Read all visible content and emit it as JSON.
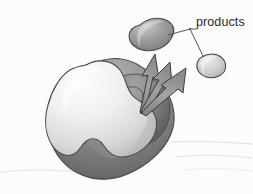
{
  "figure": {
    "kind": "enzyme-product-release-illustration",
    "style": "grayscale airbrush pencil rendering",
    "background_color": "#fcfcfc"
  },
  "labels": {
    "products": "products"
  },
  "colors": {
    "background": "#fcfcfc",
    "outline": "#4a4a4a",
    "enzyme_front_light": "#f2f2f2",
    "enzyme_front_mid": "#d7d7d7",
    "enzyme_back_dark": "#6f6f6f",
    "active_site_dark": "#777777",
    "active_site_darker": "#555555",
    "product_large_dark": "#8a8a8a",
    "product_small_light": "#cfcfcf",
    "arrow_fill": "#9a9a9a",
    "arrow_edge": "#3f3f3f",
    "ground_line": "#e2e2e2",
    "text": "#2b2b2b",
    "leader_line": "#555555"
  },
  "elements": {
    "enzyme_body": "enzyme-body",
    "enzyme_front_lobe": "enzyme-front-lobe",
    "active_site_cleft": "active-site-cleft",
    "product_large": "product-molecule-large",
    "product_small": "product-molecule-small",
    "arrows": [
      {
        "name": "release-arrow-up",
        "from": [
          141,
          111
        ],
        "to": [
          155,
          55
        ]
      },
      {
        "name": "release-arrow-mid",
        "from": [
          141,
          111
        ],
        "to": [
          168,
          62
        ]
      },
      {
        "name": "release-arrow-right",
        "from": [
          141,
          111
        ],
        "to": [
          186,
          69
        ]
      }
    ],
    "leader_lines": [
      {
        "name": "leader-line-to-large-product",
        "points": "169,35 190,29"
      },
      {
        "name": "leader-line-to-small-product",
        "points": "190,29 204,56"
      },
      {
        "name": "leader-line-text-stub",
        "points": "190,29 196,29"
      }
    ],
    "ground_lines": [
      {
        "name": "ground-line-upper-right",
        "y": 143
      },
      {
        "name": "ground-line-lower-right",
        "y": 156
      },
      {
        "name": "ground-line-left",
        "y": 172
      }
    ]
  }
}
